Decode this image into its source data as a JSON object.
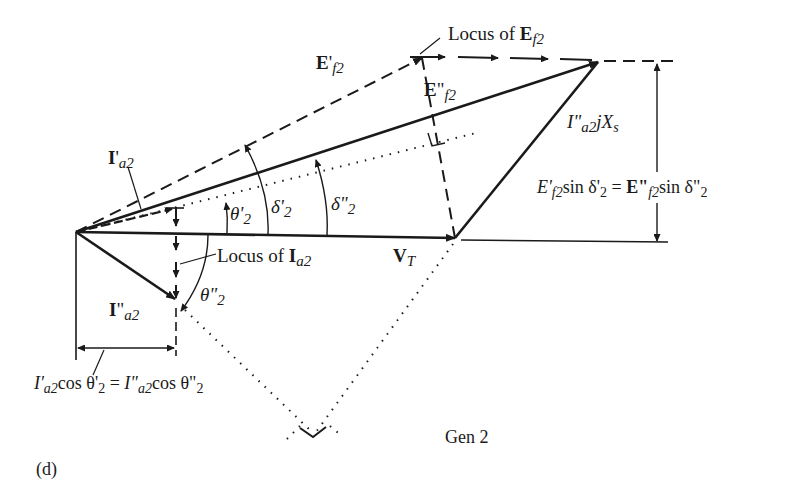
{
  "figure": {
    "panel_label": "(d)",
    "caption": "Gen 2",
    "colors": {
      "ink": "#1a1a1a",
      "background": "#ffffff"
    }
  },
  "labels": {
    "locus_ef2": {
      "prefix": "Locus of ",
      "sym": "E",
      "sub": "f2"
    },
    "e_prime_f2": {
      "sym": "E",
      "mark": "'",
      "sub": "f2"
    },
    "e_dprime_f2": {
      "sym": "E",
      "mark": "\"",
      "sub": "f2"
    },
    "ia2_jxs": {
      "sym": "I",
      "mark": "\"",
      "sub": "a2",
      "rest": "jX",
      "rest_sub": "s"
    },
    "dim_right": {
      "lhs_sym": "E'",
      "lhs_sub": "f2",
      "lhs_rest": "sin δ'",
      "lhs_rest_sub": "2",
      "eq": " = ",
      "rhs_sym": "E\"",
      "rhs_sub": "f2",
      "rhs_rest": "sin δ\"",
      "rhs_rest_sub": "2"
    },
    "i_prime_a2": {
      "sym": "I",
      "mark": "'",
      "sub": "a2"
    },
    "theta_prime_2": {
      "sym": "θ'",
      "sub": "2"
    },
    "delta_prime_2": {
      "sym": "δ'",
      "sub": "2"
    },
    "delta_dprime_2": {
      "sym": "δ\"",
      "sub": "2"
    },
    "locus_ia2": {
      "prefix": "Locus of ",
      "sym": "I",
      "sub": "a2"
    },
    "vt": {
      "sym": "V",
      "sub": "T"
    },
    "theta_dprime_2": {
      "sym": "θ\"",
      "sub": "2"
    },
    "i_dprime_a2": {
      "sym": "I",
      "mark": "\"",
      "sub": "a2"
    },
    "dim_bottom": {
      "lhs_sym": "I'",
      "lhs_sub": "a2",
      "lhs_rest": "cos θ'",
      "lhs_rest_sub": "2",
      "eq": " = ",
      "rhs_sym": "I\"",
      "rhs_sub": "a2",
      "rhs_rest": "cos θ\"",
      "rhs_rest_sub": "2"
    }
  }
}
